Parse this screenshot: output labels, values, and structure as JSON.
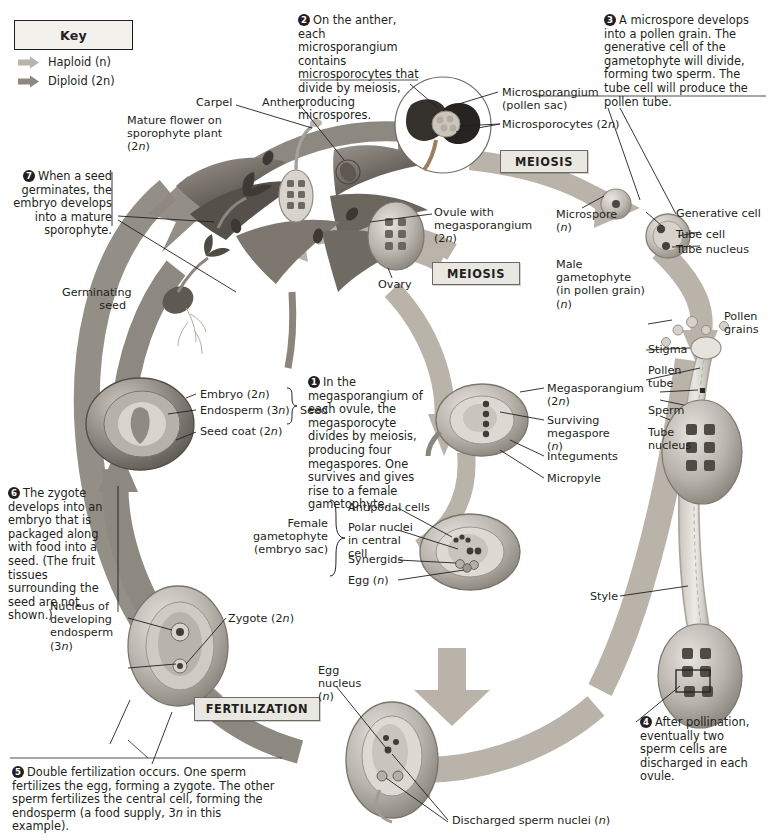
{
  "figure": {
    "colors": {
      "haploid_arrow": "#b9b3a9",
      "diploid_arrow": "#8d8880",
      "text": "#231f20",
      "box_fill": "#e9e7e1",
      "box_border": "#6d6a64",
      "key_fill": "#f2f1ec"
    }
  },
  "key": {
    "title": "Key",
    "entries": [
      {
        "label": "Haploid (n)",
        "color": "#b9b3a9",
        "name": "haploid"
      },
      {
        "label": "Diploid (2n)",
        "color": "#8d8880",
        "name": "diploid"
      }
    ]
  },
  "process_boxes": [
    {
      "label": "MEIOSIS",
      "name": "meiosis-anther"
    },
    {
      "label": "MEIOSIS",
      "name": "meiosis-ovule"
    },
    {
      "label": "FERTILIZATION",
      "name": "fertilization"
    }
  ],
  "steps": [
    {
      "number": "1",
      "text": "In the megasporangium of each ovule, the megasporocyte divides by meiosis, producing four megaspores. One survives and gives rise to a female gametophyte."
    },
    {
      "number": "2",
      "text": "On the anther, each microsporangium contains microsporocytes that divide by meiosis, producing microspores."
    },
    {
      "number": "3",
      "text": "A microspore develops into a pollen grain. The generative cell of the gametophyte will divide, forming two sperm. The tube cell will produce the pollen tube."
    },
    {
      "number": "4",
      "text": "After pollination, eventually two sperm cells are discharged in each ovule."
    },
    {
      "number": "5",
      "text": "Double fertilization occurs. One sperm fertilizes the egg, forming a zygote. The other sperm fertilizes the central cell, forming the endosperm (a food supply, 3n in this example)."
    },
    {
      "number": "6",
      "text": "The zygote develops into an embryo that is packaged along with food into a seed. (The fruit tissues surrounding the seed are not shown.)"
    },
    {
      "number": "7",
      "text": "When a seed germinates, the embryo develops into a mature sporophyte."
    }
  ],
  "labels": {
    "carpel": "Carpel",
    "anther": "Anther",
    "mature_flower": "Mature flower on sporophyte plant (2n)",
    "germinating_seed": "Germinating seed",
    "microsporangium": "Microsporangium (pollen sac)",
    "microsporocytes": "Microsporocytes (2n)",
    "ovule": "Ovule with megasporangium (2n)",
    "ovary": "Ovary",
    "microspore": "Microspore (n)",
    "male_gametophyte": "Male gametophyte (in pollen grain) (n)",
    "generative_cell": "Generative cell",
    "tube_cell": "Tube cell",
    "tube_nucleus_top": "Tube nucleus",
    "pollen_grains": "Pollen grains",
    "stigma": "Stigma",
    "pollen_tube": "Pollen tube",
    "sperm": "Sperm",
    "tube_nucleus_side": "Tube nucleus",
    "style": "Style",
    "megasporangium": "Megasporangium (2n)",
    "surviving_megaspore": "Surviving megaspore (n)",
    "integuments": "Integuments",
    "micropyle": "Micropyle",
    "antipodal_cells": "Antipodal cells",
    "polar_nuclei": "Polar nuclei in central cell",
    "synergids": "Synergids",
    "egg_n": "Egg (n)",
    "female_gametophyte": "Female gametophyte (embryo sac)",
    "embryo": "Embryo (2n)",
    "endosperm": "Endosperm (3n)",
    "seed_coat": "Seed coat (2n)",
    "seed_bracket": "Seed",
    "nucleus_endosperm": "Nucleus of developing endosperm (3n)",
    "zygote": "Zygote (2n)",
    "egg_nucleus": "Egg nucleus (n)",
    "discharged_sperm": "Discharged sperm nuclei (n)"
  }
}
